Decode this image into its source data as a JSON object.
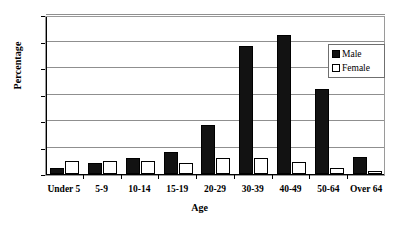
{
  "chart_data": {
    "type": "bar",
    "title": "",
    "xlabel": "Age",
    "ylabel": "Percentage",
    "categories": [
      "Under 5",
      "5-9",
      "10-14",
      "15-19",
      "20-29",
      "30-39",
      "40-49",
      "50-64",
      "Over 64"
    ],
    "series": [
      {
        "name": "Male",
        "color": "#121212",
        "values": [
          1.1,
          2.1,
          3.1,
          4.2,
          9.2,
          24.1,
          26.2,
          16.1,
          3.2
        ]
      },
      {
        "name": "Female",
        "color": "#ffffff",
        "values": [
          2.5,
          2.4,
          2.4,
          2.1,
          3.1,
          3.1,
          2.2,
          1.1,
          0.5
        ]
      }
    ],
    "ylim": [
      0,
      30
    ],
    "yticks": [
      0,
      5,
      10,
      15,
      20,
      25,
      30
    ],
    "ytick_labels": [
      "0",
      "5",
      "10",
      "15",
      "20",
      "25",
      "30"
    ],
    "grid": true,
    "legend_position": "upper right",
    "legend_entries": [
      "Male",
      "Female"
    ]
  }
}
